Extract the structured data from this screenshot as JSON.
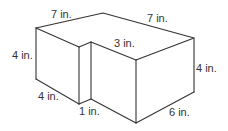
{
  "figure": {
    "type": "L-shaped prism",
    "stroke_color": "#333333",
    "background": "#ffffff",
    "labels": {
      "top_left_edge": "7 in.",
      "top_right_edge": "7 in.",
      "left_height": "4 in.",
      "notch_depth": "3 in.",
      "right_height": "4 in.",
      "bottom_left_edge": "4 in.",
      "notch_width": "1 in.",
      "bottom_right_edge": "6 in."
    }
  }
}
